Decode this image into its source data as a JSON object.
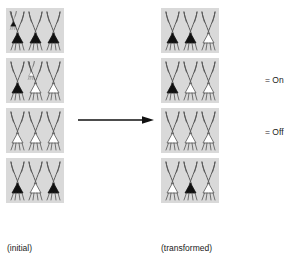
{
  "figure": {
    "top_cut_text": "",
    "arrow": {
      "direction": "right",
      "name": "transformation-arrow"
    },
    "captions": {
      "initial": "(initial)",
      "transformed": "(transformed)"
    },
    "legend": {
      "on_label": "= On",
      "off_label": "= Off",
      "on_state": "on",
      "off_state": "off"
    },
    "colors": {
      "panel_background": "#d9d9d9",
      "neuron_outline": "#555555",
      "neuron_fill_on": "#101010",
      "neuron_fill_off": "#ffffff",
      "page_background": "#ffffff",
      "text": "#1a1a1a",
      "arrow": "#111111"
    },
    "panel_count": 4,
    "neurons_per_panel": 3
  },
  "chart_data": {
    "type": "table",
    "columns": [
      "initial",
      "transformed"
    ],
    "row_labels": [
      "row-1",
      "row-2",
      "row-3",
      "row-4"
    ],
    "cell_states": [
      "on",
      "off"
    ],
    "initial": [
      [
        "on",
        "on",
        "on"
      ],
      [
        "on",
        "off",
        "off"
      ],
      [
        "off",
        "off",
        "off"
      ],
      [
        "on",
        "off",
        "on"
      ]
    ],
    "transformed": [
      [
        "on",
        "on",
        "off"
      ],
      [
        "on",
        "off",
        "off"
      ],
      [
        "off",
        "off",
        "off"
      ],
      [
        "off",
        "on",
        "off"
      ]
    ],
    "legend": [
      {
        "symbol": "filled-triangle",
        "label": "= On"
      },
      {
        "symbol": "open-triangle",
        "label": "= Off"
      }
    ],
    "annotations": [
      "(initial)",
      "(transformed)"
    ]
  }
}
